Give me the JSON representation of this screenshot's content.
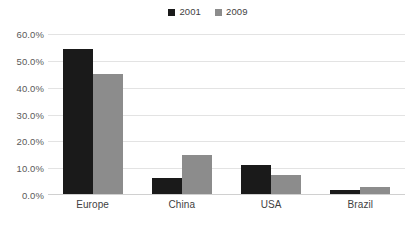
{
  "chart_data": {
    "type": "bar",
    "title": "",
    "subtitle": "",
    "xlabel": "",
    "ylabel": "",
    "categories": [
      "Europe",
      "China",
      "USA",
      "Brazil"
    ],
    "series": [
      {
        "name": "2001",
        "color": "#1a1a1a",
        "values": [
          54.5,
          6.5,
          11.0,
          2.0
        ]
      },
      {
        "name": "2009",
        "color": "#8c8c8c",
        "values": [
          45.0,
          15.0,
          7.3,
          3.0
        ]
      }
    ],
    "ylim": [
      0,
      60
    ],
    "ytick_step": 10,
    "ytick_labels": [
      "60.0%",
      "50.0%",
      "40.0%",
      "30.0%",
      "20.0%",
      "10.0%",
      "0.0%"
    ],
    "ytick_values": [
      60,
      50,
      40,
      30,
      20,
      10,
      0
    ],
    "value_suffix": "%",
    "grid": true,
    "grid_color": "#e3e3e3",
    "legend_position": "top-center",
    "background": "#ffffff"
  }
}
